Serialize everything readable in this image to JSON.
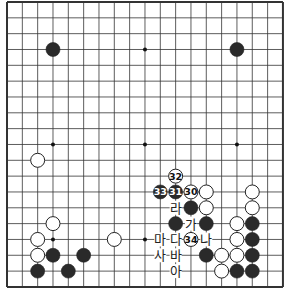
{
  "board": {
    "size": 19,
    "origin_x": 7,
    "origin_y": 2,
    "spacing_x": 15.33,
    "spacing_y": 15.83,
    "line_color": "#333333",
    "black_color": "#2a2a2a",
    "white_color": "#ffffff",
    "star_points": [
      [
        3,
        3
      ],
      [
        9,
        3
      ],
      [
        15,
        3
      ],
      [
        3,
        9
      ],
      [
        9,
        9
      ],
      [
        15,
        9
      ],
      [
        3,
        15
      ],
      [
        9,
        15
      ],
      [
        15,
        15
      ]
    ]
  },
  "stones": [
    {
      "color": "black",
      "col": 3,
      "row": 3
    },
    {
      "color": "black",
      "col": 15,
      "row": 3
    },
    {
      "color": "white",
      "col": 2,
      "row": 10
    },
    {
      "color": "white",
      "col": 3,
      "row": 14
    },
    {
      "color": "white",
      "col": 2,
      "row": 15
    },
    {
      "color": "white",
      "col": 7,
      "row": 15
    },
    {
      "color": "white",
      "col": 2,
      "row": 16
    },
    {
      "color": "black",
      "col": 3,
      "row": 16
    },
    {
      "color": "black",
      "col": 5,
      "row": 16
    },
    {
      "color": "black",
      "col": 2,
      "row": 17
    },
    {
      "color": "black",
      "col": 4,
      "row": 17
    },
    {
      "color": "white",
      "col": 11,
      "row": 11,
      "label": "32"
    },
    {
      "color": "black",
      "col": 10,
      "row": 12,
      "label": "33"
    },
    {
      "color": "black",
      "col": 11,
      "row": 12,
      "label": "31"
    },
    {
      "color": "white",
      "col": 12,
      "row": 12,
      "label": "30"
    },
    {
      "color": "white",
      "col": 13,
      "row": 12
    },
    {
      "color": "white",
      "col": 16,
      "row": 12
    },
    {
      "color": "black",
      "col": 12,
      "row": 13
    },
    {
      "color": "white",
      "col": 13,
      "row": 13
    },
    {
      "color": "white",
      "col": 16,
      "row": 13
    },
    {
      "color": "black",
      "col": 11,
      "row": 14
    },
    {
      "color": "black",
      "col": 13,
      "row": 14
    },
    {
      "color": "white",
      "col": 15,
      "row": 14
    },
    {
      "color": "black",
      "col": 16,
      "row": 14
    },
    {
      "color": "white",
      "col": 12,
      "row": 15,
      "label": "34"
    },
    {
      "color": "white",
      "col": 15,
      "row": 15
    },
    {
      "color": "black",
      "col": 16,
      "row": 15
    },
    {
      "color": "black",
      "col": 13,
      "row": 16
    },
    {
      "color": "white",
      "col": 14,
      "row": 16
    },
    {
      "color": "white",
      "col": 15,
      "row": 16
    },
    {
      "color": "black",
      "col": 16,
      "row": 16
    },
    {
      "color": "white",
      "col": 14,
      "row": 17
    },
    {
      "color": "black",
      "col": 15,
      "row": 17
    },
    {
      "color": "black",
      "col": 16,
      "row": 17
    }
  ],
  "labels": [
    {
      "text": "라",
      "col": 11,
      "row": 13
    },
    {
      "text": "가",
      "col": 12,
      "row": 14
    },
    {
      "text": "마",
      "col": 10,
      "row": 15
    },
    {
      "text": "다",
      "col": 11,
      "row": 15
    },
    {
      "text": "나",
      "col": 13,
      "row": 15
    },
    {
      "text": "사",
      "col": 10,
      "row": 16
    },
    {
      "text": "바",
      "col": 11,
      "row": 16
    },
    {
      "text": "아",
      "col": 11,
      "row": 17
    }
  ]
}
